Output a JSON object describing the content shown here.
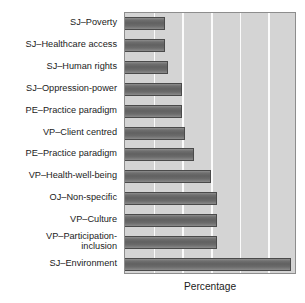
{
  "chart_data": {
    "type": "bar",
    "orientation": "horizontal",
    "title": "",
    "xlabel": "Percentage",
    "ylabel": "",
    "categories": [
      "SJ–Poverty",
      "SJ–Healthcare access",
      "SJ–Human rights",
      "SJ–Oppression-power",
      "PE–Practice paradigm",
      "VP–Client centred",
      "PE–Practice paradigm",
      "VP–Health-well-being",
      "OJ–Non-specific",
      "VP–Culture",
      "VP–Participation-\ninclusion",
      "SJ–Environment"
    ],
    "values": [
      7,
      7,
      7.5,
      10,
      10,
      10.5,
      12,
      15,
      16,
      16,
      16,
      29
    ],
    "xlim": [
      0,
      30
    ],
    "xticks": [
      0,
      5,
      10,
      15,
      20,
      25,
      30
    ],
    "grid": true,
    "grid_color": "#fbfbfb",
    "legend": "none",
    "bar_color": "#6b6b6b",
    "bar_edge_color": "#4a4a4a",
    "plot_background": "#d4d4d4",
    "figure_background": "#ffffff",
    "text_color": "#1b1b1b"
  },
  "axis": {
    "x_title": "Percentage"
  }
}
